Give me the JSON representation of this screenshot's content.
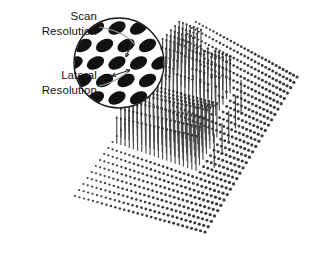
{
  "figure": {
    "background_color": "#ffffff",
    "width": 326,
    "height": 268
  },
  "labels": [
    {
      "name": "scan-resolution-label",
      "line1": "Scan",
      "line2": "Resolution",
      "x": 97,
      "y1": 20,
      "y2": 35,
      "leader": "M 99 27 C 116 30 128 36 134 44"
    },
    {
      "name": "lateral-resolution-label",
      "line1": "Lateral",
      "line2": "Resolution",
      "x": 97,
      "y1": 79,
      "y2": 94,
      "leader": "M 99 86 C 110 84 120 78 128 72"
    }
  ],
  "callout": {
    "name": "magnified-circle",
    "cx": 119,
    "cy": 63,
    "r": 45,
    "fill": "#ffffff",
    "stroke": "#1a1a1a",
    "spot_color": "#111111",
    "spot_rx": 9.2,
    "spot_ry": 6.0,
    "spot_rotation_deg": -27,
    "col_spacing": 21.5,
    "row_spacing": 17.5,
    "row_offset": 9.0,
    "rows": 7,
    "cols": 7,
    "arrows": [
      {
        "name": "scan-resolution-arrow",
        "description": "double-headed arrow spanning the scan direction spacing",
        "x1": 133,
        "y1": 40,
        "x2": 126,
        "y2": 57
      },
      {
        "name": "lateral-resolution-arrow",
        "description": "double-headed arrow spanning the lateral direction spacing",
        "x1": 112,
        "y1": 76,
        "x2": 130,
        "y2": 70
      }
    ]
  },
  "surface": {
    "name": "scan-surface-plot",
    "description": "perspective dot-matrix sample grid with raised pin structures",
    "dot_color": "#3a3a3a",
    "dot_radius": 1.35,
    "corners": {
      "top": [
        196,
        22
      ],
      "right": [
        297,
        77
      ],
      "bottom": [
        205,
        232
      ],
      "left": [
        75,
        196
      ]
    },
    "rows": 30,
    "cols": 30,
    "pin_color": "#444444",
    "raised_regions": [
      {
        "name": "dense-diagonal-band",
        "u_start": 0.3,
        "u_end": 0.52,
        "v_start": 0.02,
        "v_end": 0.72,
        "height": 42,
        "density": 1.0
      },
      {
        "name": "upper-right-block",
        "u_start": 0.56,
        "u_end": 0.88,
        "v_start": 0.0,
        "v_end": 0.22,
        "height": 40,
        "density": 1.0
      },
      {
        "name": "right-descending-band",
        "u_start": 0.62,
        "u_end": 0.8,
        "v_start": 0.2,
        "v_end": 0.62,
        "height": 38,
        "density": 0.85
      }
    ],
    "isolated_pins": [
      {
        "u": 0.36,
        "v": 0.8,
        "height": 34
      },
      {
        "u": 0.44,
        "v": 0.8,
        "height": 32
      },
      {
        "u": 0.52,
        "v": 0.79,
        "height": 31
      },
      {
        "u": 0.6,
        "v": 0.78,
        "height": 33
      },
      {
        "u": 0.68,
        "v": 0.76,
        "height": 35
      }
    ]
  }
}
